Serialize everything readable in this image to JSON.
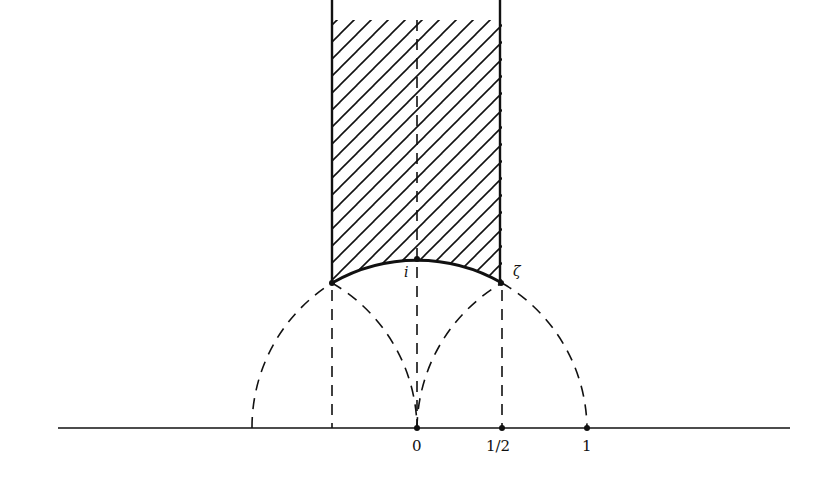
{
  "diagram": {
    "colors": {
      "ink": "#111111",
      "background": "#ffffff"
    },
    "geometry": {
      "origin_px": [
        417,
        428
      ],
      "unit_px": 170,
      "strip_left": -0.5,
      "strip_right": 0.5,
      "strip_top_px": 0
    },
    "labels": {
      "point_i": "i",
      "point_zeta": "ζ",
      "tick_0": "0",
      "tick_half": "1/2",
      "tick_1": "1"
    },
    "elements": [
      {
        "name": "real-axis",
        "type": "line",
        "style": "solid"
      },
      {
        "name": "hatched-strip",
        "type": "region",
        "style": "hatched",
        "bounds": "|Re z| ≤ 1/2, |z| ≥ 1"
      },
      {
        "name": "unit-circle-arc-bold",
        "type": "arc",
        "style": "solid-bold",
        "from": "-1/2 + i√3/2",
        "to": "1/2 + i√3/2"
      },
      {
        "name": "unit-circle-dashed",
        "type": "arc",
        "style": "dashed",
        "center": 0,
        "radius": 1
      },
      {
        "name": "circle-center-minus-1",
        "type": "arc",
        "style": "dashed",
        "center": -1,
        "radius": 1
      },
      {
        "name": "circle-center-plus-1",
        "type": "arc",
        "style": "dashed",
        "center": 1,
        "radius": 1
      },
      {
        "name": "vertical-dashed-lines",
        "type": "lines",
        "style": "dashed",
        "x": [
          -0.5,
          0,
          0.5
        ]
      }
    ]
  }
}
